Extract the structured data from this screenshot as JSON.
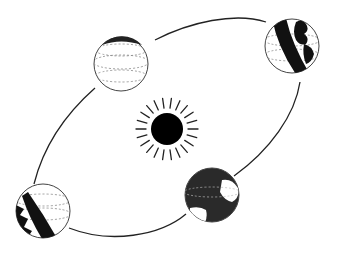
{
  "diagram": {
    "title": "Earth orbiting the Sun",
    "colors": {
      "background": "#ffffff",
      "ink": "#111111",
      "sun": "#000000",
      "shade": "#1a1a1a"
    },
    "orbit": {
      "cx": 166,
      "cy": 127,
      "rx": 150,
      "ry": 75,
      "rotation_deg": -27
    },
    "sun": {
      "cx": 167,
      "cy": 129,
      "r": 16,
      "ray_count": 22,
      "ray_inner": 21,
      "ray_outer": 31
    },
    "earths": [
      {
        "id": "top-left",
        "cx": 121,
        "cy": 64,
        "r": 27,
        "phase": "far side lit (night side hidden)"
      },
      {
        "id": "top-right",
        "cx": 292,
        "cy": 46,
        "r": 27,
        "phase": "half shaded - left"
      },
      {
        "id": "bottom-right",
        "cx": 212,
        "cy": 195,
        "r": 27,
        "phase": "near side dark (night facing viewer)"
      },
      {
        "id": "bottom-left",
        "cx": 43,
        "cy": 211,
        "r": 27,
        "phase": "half shaded - left"
      }
    ]
  }
}
